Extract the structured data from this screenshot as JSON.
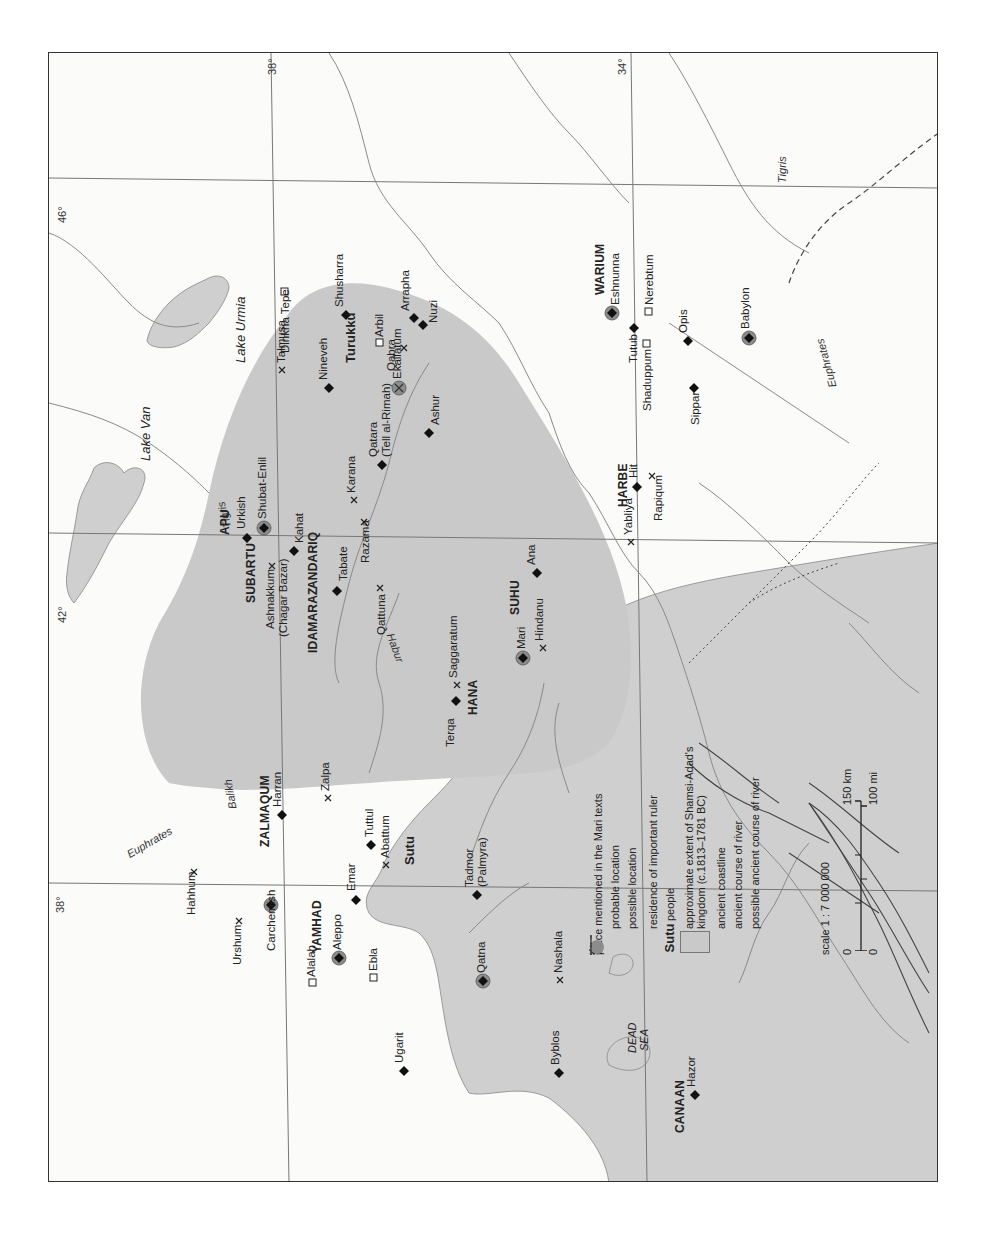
{
  "map": {
    "title": "place mentioned in the Mari texts",
    "gridlines": {
      "longitude": [
        "38°",
        "42°",
        "46°"
      ],
      "latitude": [
        "34°",
        "38°"
      ]
    },
    "colors": {
      "kingdom_fill": "#c9c9c9",
      "water_fill": "#cfcfcf",
      "river_stroke": "#8a8a8a",
      "ancient_river_stroke": "#444444",
      "grid_stroke": "#777777",
      "symbol_fill": "#111111",
      "residence_fill": "#8c8c8c"
    },
    "water_labels": {
      "lake_van": "Lake Van",
      "lake_urmia": "Lake Urmia",
      "dead_sea_1": "DEAD",
      "dead_sea_2": "SEA"
    },
    "rivers": {
      "tigris_north": "Tigris",
      "tigris_south": "Tigris",
      "euphrates_north": "Euphrates",
      "euphrates_south": "Euphrates",
      "balikh": "Balikh",
      "habur": "Habur"
    },
    "regions": {
      "apu": "APU",
      "subartu": "SUBARTU",
      "andariq": "ANDARIQ",
      "idamaraz": "IDAMARAZ",
      "zalmaqum": "ZALMAQUM",
      "suhu": "SUHU",
      "hana": "HANA",
      "harbe": "HARBE",
      "warium": "WARIUM",
      "yamhad": "YAMHAD",
      "canaan": "CANAAN"
    },
    "peoples": {
      "turukku": "Turukku",
      "sutu": "Sutu"
    },
    "places": {
      "shubat_enlil": {
        "name": "Shubat-Enlil",
        "type": "residence"
      },
      "ekallatum": {
        "name": "Ekallatum",
        "type": "residence-possible"
      },
      "mari": {
        "name": "Mari",
        "type": "residence"
      },
      "eshnunna": {
        "name": "Eshnunna",
        "type": "residence"
      },
      "babylon": {
        "name": "Babylon",
        "type": "residence"
      },
      "carchemish": {
        "name": "Carchemish",
        "type": "residence"
      },
      "aleppo": {
        "name": "Aleppo",
        "type": "residence"
      },
      "qatna": {
        "name": "Qatna",
        "type": "residence"
      },
      "shusharra": {
        "name": "Shusharra",
        "type": "probable"
      },
      "arrapha": {
        "name": "Arrapha",
        "type": "probable"
      },
      "nuzi": {
        "name": "Nuzi",
        "type": "probable"
      },
      "nineveh": {
        "name": "Nineveh",
        "type": "probable"
      },
      "qatara_1": {
        "name": "Qatara",
        "type": "probable"
      },
      "qatara_2": {
        "name": "(Tell al-Rimah)"
      },
      "ashur": {
        "name": "Ashur",
        "type": "probable"
      },
      "urkish": {
        "name": "Urkish",
        "type": "probable"
      },
      "kahat": {
        "name": "Kahat",
        "type": "probable"
      },
      "tabate": {
        "name": "Tabate",
        "type": "probable"
      },
      "terqa": {
        "name": "Terqa",
        "type": "probable"
      },
      "ana": {
        "name": "Ana",
        "type": "probable"
      },
      "hit": {
        "name": "Hit",
        "type": "probable"
      },
      "tutub": {
        "name": "Tutub",
        "type": "probable"
      },
      "opis": {
        "name": "Opis",
        "type": "probable"
      },
      "sippar": {
        "name": "Sippar",
        "type": "probable"
      },
      "harran": {
        "name": "Harran",
        "type": "probable"
      },
      "tuttul": {
        "name": "Tuttul",
        "type": "probable"
      },
      "emar": {
        "name": "Emar",
        "type": "probable"
      },
      "tadmor_1": {
        "name": "Tadmor",
        "type": "probable"
      },
      "tadmor_2": {
        "name": "(Palmyra)"
      },
      "ugarit": {
        "name": "Ugarit",
        "type": "probable"
      },
      "byblos": {
        "name": "Byblos",
        "type": "probable"
      },
      "hazor": {
        "name": "Hazor",
        "type": "probable"
      },
      "talmusa": {
        "name": "Talmusa",
        "type": "possible"
      },
      "qabra": {
        "name": "Qabra",
        "type": "possible"
      },
      "karana": {
        "name": "Karana",
        "type": "possible"
      },
      "razama": {
        "name": "Razama",
        "type": "possible"
      },
      "ashnakkum_1": {
        "name": "Ashnakkum",
        "type": "possible"
      },
      "ashnakkum_2": {
        "name": "(Chagar Bazar)"
      },
      "qattuna": {
        "name": "Qattuna",
        "type": "possible"
      },
      "saggaratum": {
        "name": "Saggaratum",
        "type": "possible"
      },
      "hindanu": {
        "name": "Hindanu",
        "type": "possible"
      },
      "yabliya": {
        "name": "Yabliya",
        "type": "possible"
      },
      "rapiqum": {
        "name": "Rapiqum",
        "type": "possible"
      },
      "zalpa": {
        "name": "Zalpa",
        "type": "possible"
      },
      "abattum": {
        "name": "Abattum",
        "type": "possible"
      },
      "hahhum": {
        "name": "Hahhum",
        "type": "possible"
      },
      "urshum": {
        "name": "Urshum",
        "type": "possible"
      },
      "nashala": {
        "name": "Nashala",
        "type": "possible"
      },
      "dinkha_tepe": {
        "name": "Dinkha Tepe",
        "type": "other"
      },
      "arbil": {
        "name": "Arbil",
        "type": "other"
      },
      "nerebtum": {
        "name": "Nerebtum",
        "type": "other"
      },
      "shaduppum": {
        "name": "Shaduppum",
        "type": "other"
      },
      "alalah": {
        "name": "Alalah",
        "type": "other"
      },
      "ebla": {
        "name": "Ebla",
        "type": "other"
      }
    },
    "legend": {
      "heading": "place mentioned in the Mari texts",
      "probable": "probable location",
      "possible": "possible location",
      "residence": "residence of important ruler",
      "people_sample": "Sutu",
      "people": "people",
      "kingdom": "approximate extent of Shamsi-Adad's kingdom (c.1813–1781 BC)",
      "coastline": "ancient coastline",
      "river": "ancient course of river",
      "possible_river": "possible ancient course of river"
    },
    "scale": {
      "ratio": "scale 1 : 7 000 000",
      "km_zero": "0",
      "km_max": "150 km",
      "mi_zero": "0",
      "mi_max": "100 mi"
    }
  }
}
